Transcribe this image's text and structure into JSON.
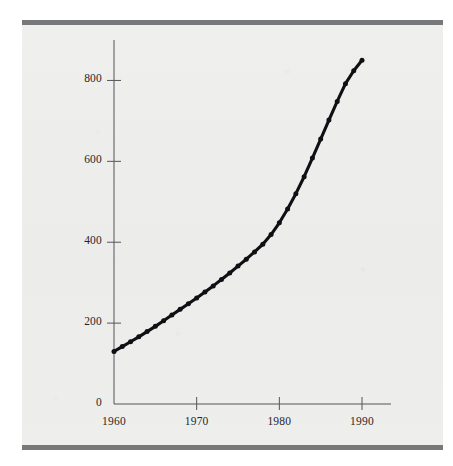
{
  "figure": {
    "background_color": "#eeeeec",
    "rule_color": "#77787a",
    "ink_color": "#101014",
    "top_rule_name": "top-horizontal-rule",
    "bottom_rule_name": "bottom-horizontal-rule"
  },
  "chart_data": {
    "type": "line",
    "title": "",
    "subtitle": "",
    "xlabel": "",
    "ylabel": "",
    "xlim": [
      1960,
      1990
    ],
    "ylim": [
      0,
      900
    ],
    "grid": false,
    "legend": false,
    "legend_position": "none",
    "marker": "dot",
    "line_color": "#101014",
    "x_ticks": [
      1960,
      1970,
      1980,
      1990
    ],
    "x_tick_labels": [
      "1960",
      "1970",
      "1980",
      "1990"
    ],
    "y_ticks": [
      0,
      200,
      400,
      600,
      800
    ],
    "y_tick_labels": [
      "0",
      "200",
      "400",
      "600",
      "800"
    ],
    "x": [
      1960,
      1961,
      1962,
      1963,
      1964,
      1965,
      1966,
      1967,
      1968,
      1969,
      1970,
      1971,
      1972,
      1973,
      1974,
      1975,
      1976,
      1977,
      1978,
      1979,
      1980,
      1981,
      1982,
      1983,
      1984,
      1985,
      1986,
      1987,
      1988,
      1989,
      1990
    ],
    "values": [
      130,
      142,
      154,
      166,
      179,
      192,
      206,
      220,
      234,
      248,
      262,
      277,
      292,
      308,
      324,
      341,
      358,
      376,
      395,
      419,
      448,
      482,
      520,
      562,
      608,
      655,
      702,
      748,
      792,
      824,
      850
    ],
    "series": [
      {
        "name": "series-1",
        "values": [
          130,
          142,
          154,
          166,
          179,
          192,
          206,
          220,
          234,
          248,
          262,
          277,
          292,
          308,
          324,
          341,
          358,
          376,
          395,
          419,
          448,
          482,
          520,
          562,
          608,
          655,
          702,
          748,
          792,
          824,
          850
        ]
      }
    ],
    "annotations": []
  }
}
